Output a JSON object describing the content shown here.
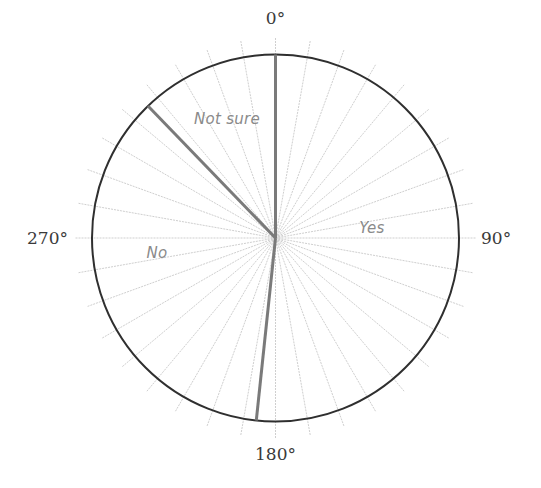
{
  "chart_data": {
    "type": "pie",
    "title": "",
    "style": "outline pie on a 360-degree protractor dial (radial guide lines every 10 degrees)",
    "start_angle_deg": 0,
    "direction": "clockwise",
    "categories": [
      "Yes",
      "No",
      "Not sure"
    ],
    "angles_deg": [
      {
        "label": "Yes",
        "start": 0,
        "end": 186
      },
      {
        "label": "No",
        "start": 186,
        "end": 316
      },
      {
        "label": "Not sure",
        "start": 316,
        "end": 360
      }
    ],
    "values_percent": [
      51.7,
      36.1,
      12.2
    ],
    "axis_labels": [
      "0°",
      "90°",
      "180°",
      "270°"
    ],
    "guide_line_step_deg": 10,
    "legend": "none (labels inside slices)"
  },
  "labels": {
    "deg_0": "0°",
    "deg_90": "90°",
    "deg_180": "180°",
    "deg_270": "270°",
    "yes": "Yes",
    "no": "No",
    "not_sure": "Not sure"
  },
  "colors": {
    "circle_outline": "#2f2f2f",
    "separator": "#7a7a7a",
    "guide_lines": "#cfcfcf",
    "slice_label": "#8a8a8a",
    "axis_label": "#3a3a3a"
  }
}
